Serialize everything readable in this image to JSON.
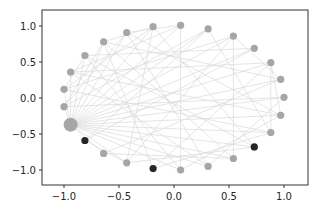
{
  "chart_data": {
    "type": "scatter",
    "subtype": "network-graph-circular-layout",
    "title": "",
    "xlabel": "",
    "ylabel": "",
    "xlim": [
      -1.2,
      1.2
    ],
    "ylim": [
      -1.2,
      1.2
    ],
    "grid": false,
    "legend": null,
    "x_ticks": [
      -1.0,
      -0.5,
      0.0,
      0.5,
      1.0
    ],
    "x_tick_labels": [
      "−1.0",
      "−0.5",
      "0.0",
      "0.5",
      "1.0"
    ],
    "y_ticks": [
      1.0,
      0.5,
      0.0,
      -0.5,
      -1.0
    ],
    "y_tick_labels": [
      "1.0",
      "0.5",
      "0.0",
      "−0.5",
      "−1.0"
    ],
    "colors": {
      "node_default": "#a6a6a6",
      "node_highlight": "#262626",
      "node_hub": "#a6a6a6",
      "edge": "#d9d9d9",
      "axes": "#333333",
      "background": "#ffffff"
    },
    "nodes": [
      {
        "id": 0,
        "x": -0.94,
        "y": -0.37,
        "size": "large",
        "type": "hub"
      },
      {
        "id": 1,
        "x": -0.81,
        "y": -0.59,
        "size": "small",
        "type": "highlight"
      },
      {
        "id": 2,
        "x": -0.64,
        "y": -0.77,
        "size": "small",
        "type": "default"
      },
      {
        "id": 3,
        "x": -0.43,
        "y": -0.9,
        "size": "small",
        "type": "default"
      },
      {
        "id": 4,
        "x": -0.19,
        "y": -0.98,
        "size": "small",
        "type": "highlight"
      },
      {
        "id": 5,
        "x": 0.06,
        "y": -1.0,
        "size": "small",
        "type": "default"
      },
      {
        "id": 6,
        "x": 0.31,
        "y": -0.95,
        "size": "small",
        "type": "default"
      },
      {
        "id": 7,
        "x": 0.54,
        "y": -0.84,
        "size": "small",
        "type": "default"
      },
      {
        "id": 8,
        "x": 0.73,
        "y": -0.68,
        "size": "small",
        "type": "highlight"
      },
      {
        "id": 9,
        "x": 0.88,
        "y": -0.48,
        "size": "small",
        "type": "default"
      },
      {
        "id": 10,
        "x": 0.97,
        "y": -0.24,
        "size": "small",
        "type": "default"
      },
      {
        "id": 11,
        "x": 1.0,
        "y": 0.01,
        "size": "small",
        "type": "default"
      },
      {
        "id": 12,
        "x": 0.97,
        "y": 0.26,
        "size": "small",
        "type": "default"
      },
      {
        "id": 13,
        "x": 0.88,
        "y": 0.49,
        "size": "small",
        "type": "default"
      },
      {
        "id": 14,
        "x": 0.73,
        "y": 0.69,
        "size": "small",
        "type": "default"
      },
      {
        "id": 15,
        "x": 0.54,
        "y": 0.86,
        "size": "small",
        "type": "default"
      },
      {
        "id": 16,
        "x": 0.31,
        "y": 0.96,
        "size": "small",
        "type": "default"
      },
      {
        "id": 17,
        "x": 0.06,
        "y": 1.01,
        "size": "small",
        "type": "default"
      },
      {
        "id": 18,
        "x": -0.19,
        "y": 0.99,
        "size": "small",
        "type": "default"
      },
      {
        "id": 19,
        "x": -0.43,
        "y": 0.91,
        "size": "small",
        "type": "default"
      },
      {
        "id": 20,
        "x": -0.64,
        "y": 0.78,
        "size": "small",
        "type": "default"
      },
      {
        "id": 21,
        "x": -0.81,
        "y": 0.59,
        "size": "small",
        "type": "default"
      },
      {
        "id": 22,
        "x": -0.94,
        "y": 0.36,
        "size": "small",
        "type": "default"
      },
      {
        "id": 23,
        "x": -1.0,
        "y": 0.12,
        "size": "small",
        "type": "default"
      },
      {
        "id": 24,
        "x": -1.0,
        "y": -0.12,
        "size": "small",
        "type": "default"
      }
    ],
    "edges": [
      [
        0,
        2
      ],
      [
        0,
        3
      ],
      [
        0,
        5
      ],
      [
        0,
        6
      ],
      [
        0,
        7
      ],
      [
        0,
        8
      ],
      [
        0,
        9
      ],
      [
        0,
        10
      ],
      [
        0,
        11
      ],
      [
        0,
        12
      ],
      [
        0,
        13
      ],
      [
        0,
        14
      ],
      [
        0,
        15
      ],
      [
        0,
        16
      ],
      [
        0,
        17
      ],
      [
        0,
        18
      ],
      [
        0,
        19
      ],
      [
        0,
        20
      ],
      [
        0,
        21
      ],
      [
        0,
        22
      ],
      [
        0,
        23
      ],
      [
        0,
        24
      ],
      [
        1,
        14
      ],
      [
        1,
        16
      ],
      [
        2,
        12
      ],
      [
        3,
        15
      ],
      [
        3,
        18
      ],
      [
        4,
        13
      ],
      [
        4,
        20
      ],
      [
        5,
        17
      ],
      [
        5,
        21
      ],
      [
        6,
        19
      ],
      [
        6,
        22
      ],
      [
        7,
        15
      ],
      [
        7,
        20
      ],
      [
        8,
        18
      ],
      [
        8,
        21
      ],
      [
        9,
        16
      ],
      [
        9,
        23
      ],
      [
        10,
        19
      ],
      [
        10,
        22
      ],
      [
        11,
        24
      ],
      [
        12,
        20
      ],
      [
        13,
        22
      ],
      [
        14,
        21
      ],
      [
        15,
        23
      ],
      [
        16,
        24
      ],
      [
        17,
        22
      ],
      [
        18,
        23
      ],
      [
        19,
        24
      ],
      [
        20,
        24
      ],
      [
        21,
        23
      ],
      [
        12,
        15
      ],
      [
        9,
        13
      ],
      [
        10,
        13
      ],
      [
        4,
        9
      ],
      [
        3,
        8
      ],
      [
        2,
        7
      ],
      [
        5,
        10
      ],
      [
        6,
        11
      ],
      [
        1,
        3
      ],
      [
        18,
        20
      ],
      [
        17,
        19
      ]
    ]
  }
}
